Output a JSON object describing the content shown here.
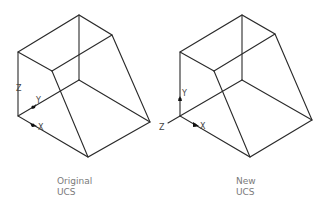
{
  "diagram": {
    "type": "isometric-ucs-comparison",
    "colors": {
      "edge": "#2a2a2a",
      "label": "#444444",
      "caption": "#7a7a7a"
    },
    "figures": [
      {
        "id": "original",
        "caption_line1": "Original",
        "caption_line2": "UCS",
        "axes": {
          "x_label": "X",
          "y_label": "Y",
          "z_label": "Z"
        }
      },
      {
        "id": "new",
        "caption_line1": "New",
        "caption_line2": "UCS",
        "axes": {
          "x_label": "X",
          "y_label": "Y",
          "z_label": "Z"
        }
      }
    ]
  }
}
